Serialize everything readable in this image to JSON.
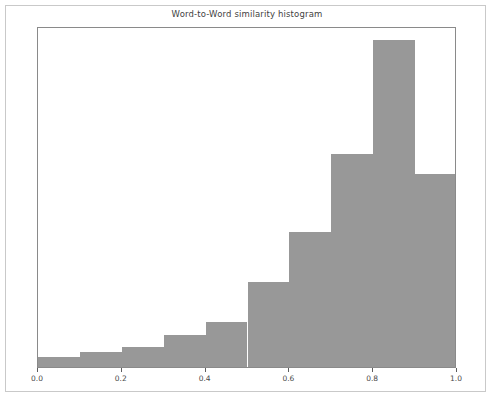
{
  "figure": {
    "title": "Word-to-Word similarity histogram",
    "background_color": "#ffffff",
    "frame_color": "#c9c9c9"
  },
  "chart_data": {
    "type": "bar",
    "title": "Word-to-Word similarity histogram",
    "xlabel": "",
    "ylabel": "",
    "grid": false,
    "legend": null,
    "bar_color": "#989898",
    "axis_color": "#8a8a8a",
    "xlim": [
      0.0,
      1.0
    ],
    "ylim": [
      0.0,
      1.0
    ],
    "bin_edges": [
      0.0,
      0.1,
      0.2,
      0.3,
      0.4,
      0.5,
      0.6,
      0.7,
      0.8,
      0.9,
      1.0
    ],
    "categories": [
      "0.0-0.1",
      "0.1-0.2",
      "0.2-0.3",
      "0.3-0.4",
      "0.4-0.5",
      "0.5-0.6",
      "0.6-0.7",
      "0.7-0.8",
      "0.8-0.9",
      "0.9-1.0"
    ],
    "values": [
      0.029,
      0.044,
      0.059,
      0.094,
      0.132,
      0.249,
      0.396,
      0.625,
      0.959,
      0.566
    ],
    "xticks": [
      0.0,
      0.2,
      0.4,
      0.6,
      0.8,
      1.0
    ],
    "xticklabels": [
      "0.0",
      "0.2",
      "0.4",
      "0.6",
      "0.8",
      "1.0"
    ],
    "yticks": [],
    "yticklabels": []
  }
}
